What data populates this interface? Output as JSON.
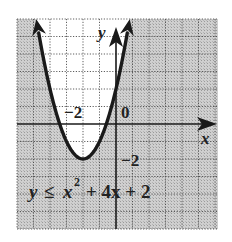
{
  "chart_data": {
    "type": "line",
    "title": "",
    "equation": "y ≤ x² + 4x + 2",
    "equation_parts": {
      "lhs": "y",
      "op": "≤",
      "x": "x",
      "exp": "2",
      "rest": "+ 4x + 2"
    },
    "xlabel": "x",
    "ylabel": "y",
    "xlim": [
      -6,
      6
    ],
    "ylim": [
      -6,
      6
    ],
    "grid": true,
    "tick_labels": {
      "x": [
        "-2"
      ],
      "y": [
        "-2"
      ],
      "origin": "0"
    },
    "display_labels": {
      "x_neg2": "−2",
      "y_neg2": "−2",
      "origin": "0"
    },
    "series": [
      {
        "name": "y = x^2 + 4x + 2",
        "boundary": "solid",
        "shaded_region": "below/outside the parabola (y ≤ x² + 4x + 2)",
        "vertex": [
          -2,
          -2
        ],
        "x": [
          -4.83,
          -4,
          -3,
          -2,
          -1,
          0,
          0.83
        ],
        "values": [
          6,
          2,
          -1,
          -2,
          -1,
          2,
          6
        ]
      }
    ],
    "colors": {
      "shade": "#c8c8c8",
      "grid": "#555555",
      "curve": "#1a1a1a",
      "unshaded": "#ffffff"
    }
  }
}
